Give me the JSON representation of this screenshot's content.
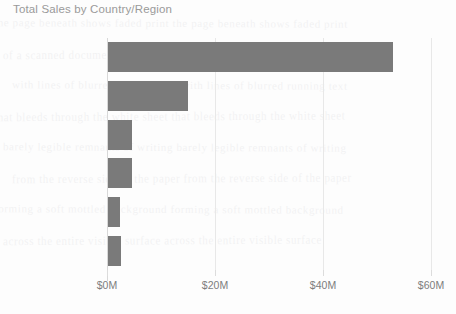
{
  "chart_data": {
    "type": "bar",
    "orientation": "horizontal",
    "title": "Total Sales by Country/Region",
    "xlabel": "",
    "ylabel": "",
    "categories": [
      "United States",
      "Canada",
      "France",
      "United Kingdom",
      "Germany",
      "Australia"
    ],
    "values": [
      52.8,
      14.8,
      4.4,
      4.4,
      2.2,
      2.4
    ],
    "value_unit": "M",
    "xlim": [
      0,
      60
    ],
    "xticks": [
      0,
      20,
      40,
      60
    ],
    "xtick_labels": [
      "$0M",
      "$20M",
      "$40M",
      "$60M"
    ],
    "grid": true,
    "legend": false,
    "bar_color": "#7a7a7a",
    "gridline_color": "#e8e8e8",
    "title_color": "#9a9a9a",
    "label_color": "#7d7d7d",
    "background_color": "#fdfdfd"
  },
  "ghost_text": [
    "the page beneath shows faded print",
    "of a scanned document underneath",
    "with lines of blurred running text",
    "that bleeds through the white sheet",
    "barely legible remnants of writing",
    "from the reverse side of the paper",
    "forming a soft mottled background",
    "across the entire visible surface"
  ]
}
